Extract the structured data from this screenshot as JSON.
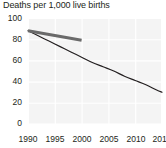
{
  "chart_data": {
    "type": "line",
    "title": "Deaths per 1,000 live births",
    "xlabel": "",
    "ylabel": "",
    "xlim": [
      1990,
      2015
    ],
    "ylim": [
      0,
      100
    ],
    "grid": true,
    "legend": "none",
    "xticks": [
      "1990",
      "1995",
      "2000",
      "2005",
      "2010",
      "2015"
    ],
    "yticks": [
      "0",
      "20",
      "40",
      "60",
      "80",
      "100"
    ],
    "series": [
      {
        "name": "observed-decline",
        "color": "#231f20",
        "width": 1.2,
        "x": [
          1990,
          1992,
          1994,
          1996,
          1998,
          2000,
          2002,
          2004,
          2006,
          2008,
          2010,
          2012,
          2014,
          2015
        ],
        "values": [
          88,
          83,
          78,
          73,
          68,
          63,
          58,
          54,
          50,
          45,
          41,
          37,
          32,
          30
        ]
      },
      {
        "name": "reference-trend",
        "color": "#6a6a6a",
        "width": 3.0,
        "x": [
          1990,
          1995,
          2000
        ],
        "values": [
          88,
          83.5,
          79
        ]
      }
    ]
  },
  "axis": {
    "y_label_0": "0",
    "y_label_20": "20",
    "y_label_40": "40",
    "y_label_60": "60",
    "y_label_80": "80",
    "y_label_100": "100",
    "x_label_1990": "1990",
    "x_label_1995": "1995",
    "x_label_2000": "2000",
    "x_label_2005": "2005",
    "x_label_2010": "2010",
    "x_label_2015": "2015"
  },
  "colors": {
    "plot_background": "#f4f4f4",
    "gridline": "#ffffff",
    "text": "#231f20",
    "series_primary": "#231f20",
    "series_secondary": "#6a6a6a"
  }
}
